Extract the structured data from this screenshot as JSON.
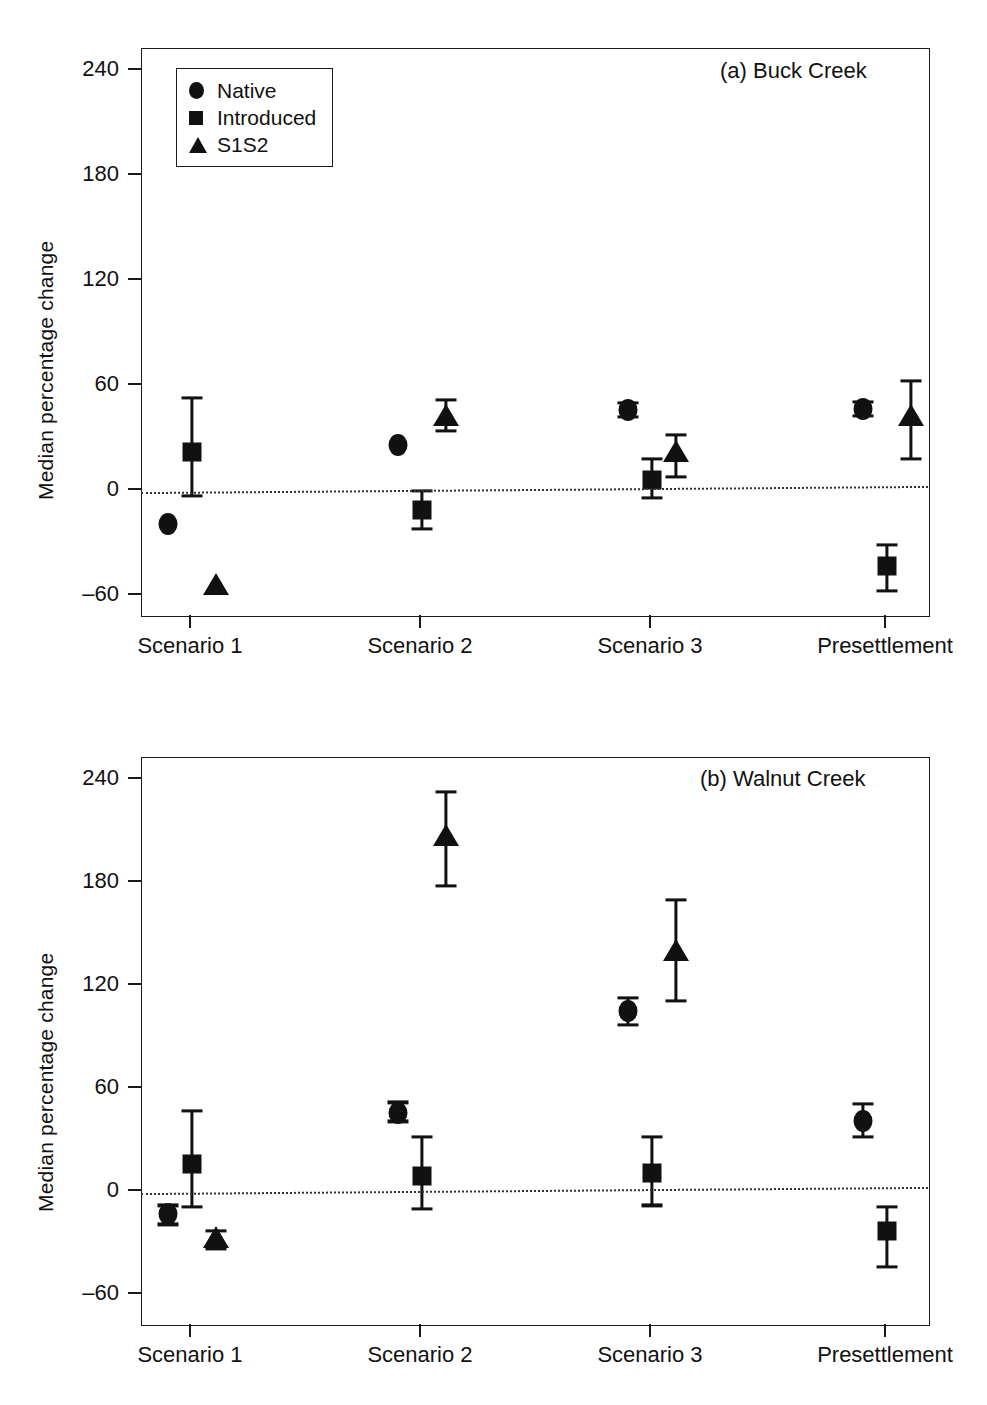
{
  "figure": {
    "ylabel": "Median percentage change",
    "y_ticks": [
      "240",
      "180",
      "120",
      "60",
      "0",
      "–60"
    ],
    "x_ticks": [
      "Scenario 1",
      "Scenario 2",
      "Scenario 3",
      "Presettlement"
    ],
    "legend": [
      {
        "marker": "circle",
        "label": "Native"
      },
      {
        "marker": "square",
        "label": "Introduced"
      },
      {
        "marker": "triangle",
        "label": "S1S2"
      }
    ]
  },
  "panel_a": {
    "tag": "(a) Buck Creek"
  },
  "panel_b": {
    "tag": "(b) Walnut Creek"
  },
  "chart_data": [
    {
      "type": "scatter",
      "title": "(a) Buck Creek",
      "xlabel": "",
      "ylabel": "Median percentage change",
      "ylim": [
        -80,
        265
      ],
      "yticks": [
        240,
        180,
        120,
        60,
        0,
        -60
      ],
      "categories": [
        "Scenario 1",
        "Scenario 2",
        "Scenario 3",
        "Presettlement"
      ],
      "grid": false,
      "reference_line": 0,
      "legend_position": "top-left",
      "series": [
        {
          "name": "Native",
          "marker": "circle",
          "values": [
            -20,
            25,
            45,
            46
          ],
          "err_low": [
            -20,
            25,
            41,
            42
          ],
          "err_high": [
            -20,
            25,
            49,
            50
          ]
        },
        {
          "name": "Introduced",
          "marker": "square",
          "values": [
            21,
            -12,
            5,
            -44
          ],
          "err_low": [
            -4,
            -23,
            -5,
            -58
          ],
          "err_high": [
            52,
            -1,
            17,
            -32
          ]
        },
        {
          "name": "S1S2",
          "marker": "triangle",
          "values": [
            -55,
            42,
            21,
            42
          ],
          "err_low": [
            -55,
            33,
            7,
            17
          ],
          "err_high": [
            -55,
            51,
            31,
            62
          ]
        }
      ]
    },
    {
      "type": "scatter",
      "title": "(b) Walnut Creek",
      "xlabel": "",
      "ylabel": "Median percentage change",
      "ylim": [
        -80,
        265
      ],
      "yticks": [
        240,
        180,
        120,
        60,
        0,
        -60
      ],
      "categories": [
        "Scenario 1",
        "Scenario 2",
        "Scenario 3",
        "Presettlement"
      ],
      "grid": false,
      "reference_line": 0,
      "legend_position": "none",
      "series": [
        {
          "name": "Native",
          "marker": "circle",
          "values": [
            -14,
            45,
            104,
            40
          ],
          "err_low": [
            -20,
            40,
            96,
            31
          ],
          "err_high": [
            -9,
            51,
            112,
            50
          ]
        },
        {
          "name": "Introduced",
          "marker": "square",
          "values": [
            15,
            8,
            10,
            -24
          ],
          "err_low": [
            -10,
            -11,
            -9,
            -45
          ],
          "err_high": [
            46,
            31,
            31,
            -10
          ]
        },
        {
          "name": "S1S2",
          "marker": "triangle",
          "values": [
            -28,
            206,
            139,
            null
          ],
          "err_low": [
            -34,
            177,
            110,
            null
          ],
          "err_high": [
            -24,
            232,
            169,
            null
          ]
        }
      ]
    }
  ]
}
